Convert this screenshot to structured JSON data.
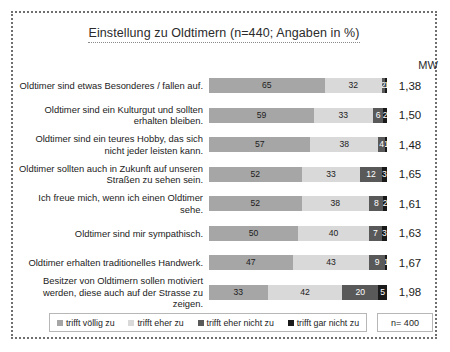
{
  "chart_data": {
    "type": "bar",
    "title": "Einstellung zu Oldtimern (n=440; Angaben in %)",
    "xlabel": "",
    "ylabel": "",
    "stacked": true,
    "orientation": "horizontal",
    "xlim": [
      0,
      100
    ],
    "grid": false,
    "legend_position": "bottom",
    "value_column_header": "MW",
    "sample_note": "n= 400",
    "categories": [
      "Oldtimer sind etwas Besonderes / fallen auf.",
      "Oldtimer sind ein Kulturgut und sollten erhalten bleiben.",
      "Oldtimer sind ein teures Hobby, das sich nicht jeder leisten kann.",
      "Oldtimer sollten auch in Zukunft auf unseren Straßen zu sehen sein.",
      "Ich freue mich, wenn ich einen Oldtimer sehe.",
      "Oldtimer sind mir sympathisch.",
      "Oldtimer erhalten traditionelles Handwerk.",
      "Besitzer von Oldtimern sollen motiviert werden, diese auch auf der Strasse zu zeigen."
    ],
    "series": [
      {
        "name": "trifft völlig zu",
        "color": "#a6a6a6",
        "values": [
          65,
          59,
          57,
          52,
          52,
          50,
          47,
          33
        ]
      },
      {
        "name": "trifft eher zu",
        "color": "#d9d9d9",
        "values": [
          32,
          33,
          38,
          33,
          38,
          40,
          43,
          42
        ]
      },
      {
        "name": "trifft eher nicht zu",
        "color": "#595959",
        "values": [
          2,
          6,
          4,
          12,
          8,
          7,
          9,
          20
        ]
      },
      {
        "name": "trifft gar nicht zu",
        "color": "#1a1a1a",
        "values": [
          1,
          2,
          1,
          3,
          2,
          3,
          1,
          5
        ]
      }
    ],
    "means": [
      "1,38",
      "1,50",
      "1,48",
      "1,65",
      "1,61",
      "1,63",
      "1,67",
      "1,98"
    ],
    "mean_label": "MW"
  },
  "legend": {
    "items": [
      {
        "label": "trifft völlig zu",
        "color": "#a6a6a6"
      },
      {
        "label": "trifft eher zu",
        "color": "#d9d9d9"
      },
      {
        "label": "trifft eher nicht zu",
        "color": "#595959"
      },
      {
        "label": "trifft gar nicht zu",
        "color": "#1a1a1a"
      }
    ]
  },
  "footer": {
    "n_label": "n= 400"
  }
}
